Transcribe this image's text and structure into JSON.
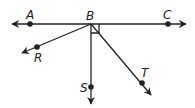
{
  "diagram": {
    "type": "geometry-rays",
    "points": {
      "A": {
        "label": "A"
      },
      "B": {
        "label": "B"
      },
      "C": {
        "label": "C"
      },
      "R": {
        "label": "R"
      },
      "S": {
        "label": "S"
      },
      "T": {
        "label": "T"
      }
    },
    "elements": [
      "line AC through B",
      "ray BR",
      "ray BS",
      "ray BT",
      "right angle CBS"
    ],
    "colors": {
      "stroke": "#222222",
      "background": "#ffffff"
    }
  }
}
